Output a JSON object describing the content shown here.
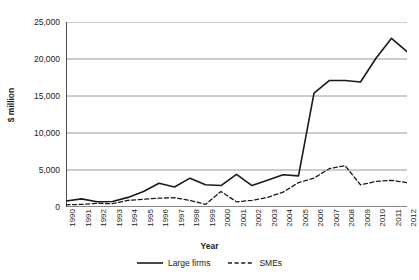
{
  "chart_data": {
    "type": "line",
    "title": "",
    "xlabel": "Year",
    "ylabel": "$ million",
    "ylim": [
      0,
      25000
    ],
    "yticks": [
      0,
      5000,
      10000,
      15000,
      20000,
      25000
    ],
    "ytick_labels": [
      "0",
      "5,000",
      "10,000",
      "15,000",
      "20,000",
      "25,000"
    ],
    "grid": true,
    "legend_position": "bottom-center",
    "categories": [
      1990,
      1991,
      1992,
      1993,
      1994,
      1995,
      1996,
      1997,
      1998,
      1999,
      2000,
      2001,
      2002,
      2003,
      2004,
      2005,
      2006,
      2007,
      2008,
      2009,
      2010,
      2011,
      2012
    ],
    "xtick_labels": [
      "1990",
      "1991",
      "1992",
      "1993",
      "1994",
      "1995",
      "1996",
      "1997",
      "1998",
      "1999",
      "2000",
      "2001",
      "2002",
      "2003",
      "2004",
      "2005",
      "2006",
      "2007",
      "2008",
      "2009",
      "2010",
      "2011",
      "2012"
    ],
    "series": [
      {
        "name": "Large firms",
        "style": "solid",
        "color": "#1a1a1a",
        "values": [
          800,
          1100,
          700,
          750,
          1300,
          2100,
          3200,
          2700,
          3900,
          3000,
          2900,
          4400,
          2900,
          3600,
          4350,
          4200,
          15400,
          17100,
          17100,
          16900,
          20100,
          22800,
          21000
        ]
      },
      {
        "name": "SMEs",
        "style": "dashed",
        "color": "#1a1a1a",
        "values": [
          300,
          350,
          500,
          450,
          900,
          1050,
          1200,
          1250,
          900,
          350,
          2100,
          700,
          900,
          1300,
          2000,
          3300,
          3900,
          5200,
          5600,
          3000,
          3450,
          3600,
          3300
        ]
      }
    ]
  },
  "legend": {
    "entries": [
      {
        "label": "Large firms",
        "style": "solid"
      },
      {
        "label": "SMEs",
        "style": "dashed"
      }
    ]
  }
}
